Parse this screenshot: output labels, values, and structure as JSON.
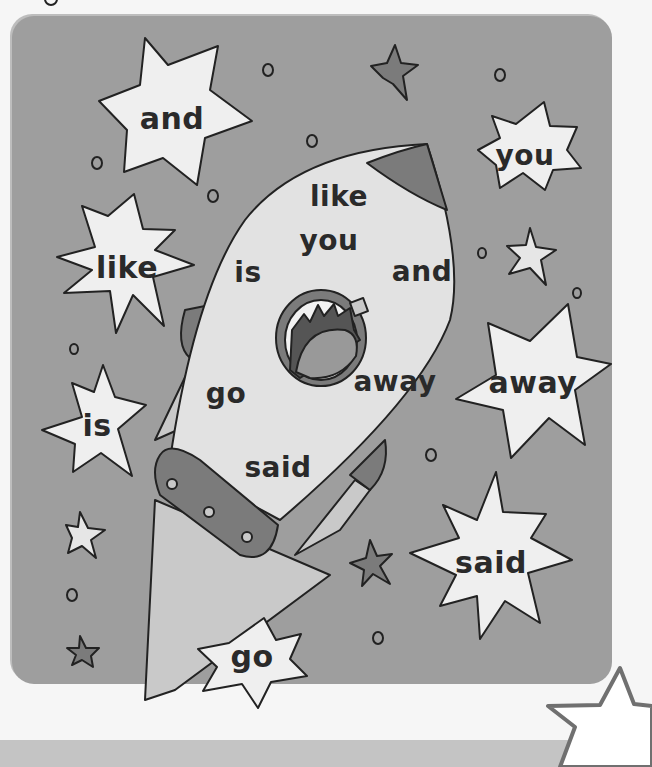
{
  "colors": {
    "panel": "#9e9e9e",
    "star_fill": "#efefef",
    "rocket_body": "#e2e2e2",
    "rocket_accent": "#7b7b7b",
    "flame": "#c9c9c9"
  },
  "stars": [
    {
      "word": "and",
      "x": 172,
      "y": 118
    },
    {
      "word": "you",
      "x": 525,
      "y": 155
    },
    {
      "word": "like",
      "x": 127,
      "y": 267
    },
    {
      "word": "away",
      "x": 533,
      "y": 382
    },
    {
      "word": "is",
      "x": 97,
      "y": 425
    },
    {
      "word": "said",
      "x": 491,
      "y": 562
    },
    {
      "word": "go",
      "x": 252,
      "y": 656
    }
  ],
  "rocket_words": [
    {
      "word": "like",
      "x": 339,
      "y": 196
    },
    {
      "word": "you",
      "x": 329,
      "y": 240
    },
    {
      "word": "is",
      "x": 248,
      "y": 272
    },
    {
      "word": "and",
      "x": 422,
      "y": 271
    },
    {
      "word": "away",
      "x": 395,
      "y": 381
    },
    {
      "word": "go",
      "x": 226,
      "y": 393
    },
    {
      "word": "said",
      "x": 278,
      "y": 467
    }
  ]
}
